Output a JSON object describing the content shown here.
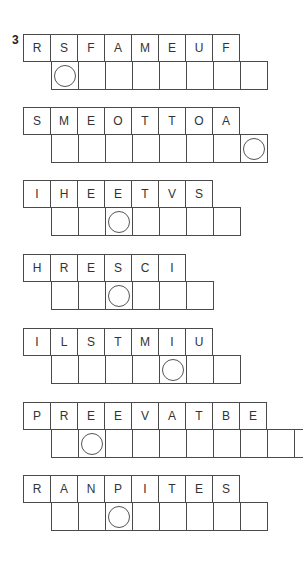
{
  "question_number": "3",
  "puzzles": [
    {
      "letters": [
        "R",
        "S",
        "F",
        "A",
        "M",
        "E",
        "U",
        "F"
      ],
      "answer_length": 8,
      "circle_index": 0,
      "top": 34
    },
    {
      "letters": [
        "S",
        "M",
        "E",
        "O",
        "T",
        "T",
        "O",
        "A"
      ],
      "answer_length": 8,
      "circle_index": 7,
      "top": 107
    },
    {
      "letters": [
        "I",
        "H",
        "E",
        "E",
        "T",
        "V",
        "S"
      ],
      "answer_length": 7,
      "circle_index": 2,
      "top": 180
    },
    {
      "letters": [
        "H",
        "R",
        "E",
        "S",
        "C",
        "I"
      ],
      "answer_length": 6,
      "circle_index": 2,
      "top": 254
    },
    {
      "letters": [
        "I",
        "L",
        "S",
        "T",
        "M",
        "I",
        "U"
      ],
      "answer_length": 7,
      "circle_index": 4,
      "top": 328
    },
    {
      "letters": [
        "P",
        "R",
        "E",
        "E",
        "V",
        "A",
        "T",
        "B",
        "E"
      ],
      "answer_length": 10,
      "circle_index": 1,
      "top": 402
    },
    {
      "letters": [
        "R",
        "A",
        "N",
        "P",
        "I",
        "T",
        "E",
        "S"
      ],
      "answer_length": 8,
      "circle_index": 2,
      "top": 475
    }
  ]
}
